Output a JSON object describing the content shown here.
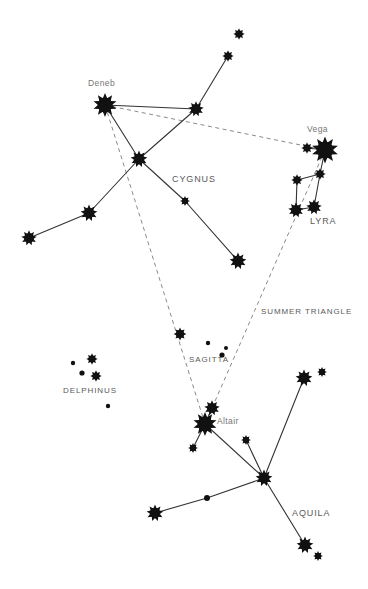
{
  "figure": {
    "kind": "star-chart",
    "title_visible": false,
    "background_color": "#ffffff",
    "star_color": "#111111",
    "line_color": "#333333",
    "dashed_color": "#8a8a8a",
    "label_color": "#6b6b6b",
    "width": 368,
    "height": 589
  },
  "labels": [
    {
      "name": "deneb-label",
      "text": "Deneb",
      "x": 88,
      "y": 78,
      "style": "label-star"
    },
    {
      "name": "vega-label",
      "text": "Vega",
      "x": 307,
      "y": 124,
      "style": "label-star"
    },
    {
      "name": "altair-label",
      "text": "Altair",
      "x": 217,
      "y": 416,
      "style": "label-star"
    },
    {
      "name": "cygnus-label",
      "text": "CYGNUS",
      "x": 172,
      "y": 174,
      "style": "label-const"
    },
    {
      "name": "lyra-label",
      "text": "LYRA",
      "x": 310,
      "y": 216,
      "style": "label-const"
    },
    {
      "name": "aquila-label",
      "text": "AQUILA",
      "x": 292,
      "y": 508,
      "style": "label-const"
    },
    {
      "name": "sagitta-label",
      "text": "SAGITTA",
      "x": 189,
      "y": 355,
      "style": "label-region"
    },
    {
      "name": "delphinus-label",
      "text": "DELPHINUS",
      "x": 63,
      "y": 386,
      "style": "label-region"
    },
    {
      "name": "summer-triangle-label",
      "text": "SUMMER TRIANGLE",
      "x": 261,
      "y": 307,
      "style": "label-region"
    }
  ],
  "stars": [
    {
      "name": "star-deneb",
      "id": "deneb",
      "x": 105,
      "y": 105,
      "r": 8.5
    },
    {
      "name": "star-vega",
      "id": "vega",
      "x": 325,
      "y": 150,
      "r": 9.5
    },
    {
      "name": "star-altair",
      "id": "altair",
      "x": 205,
      "y": 424,
      "r": 8.5
    },
    {
      "name": "star-cygnus-sadr",
      "id": "sadr",
      "x": 139,
      "y": 159,
      "r": 6.0
    },
    {
      "name": "star-cygnus-gienah-e",
      "id": "gienah-e",
      "x": 196,
      "y": 109,
      "r": 5.5
    },
    {
      "name": "star-cygnus-upper",
      "id": "cyg-up",
      "x": 228,
      "y": 56,
      "r": 4.0
    },
    {
      "name": "star-cygnus-top",
      "id": "cyg-top",
      "x": 239,
      "y": 34,
      "r": 4.0
    },
    {
      "name": "star-cygnus-gienah-w",
      "id": "gienah-w",
      "x": 89,
      "y": 213,
      "r": 6.0
    },
    {
      "name": "star-cygnus-wing-tip",
      "id": "wing-tip",
      "x": 29,
      "y": 238,
      "r": 5.5
    },
    {
      "name": "star-cygnus-eta",
      "id": "cyg-eta",
      "x": 185,
      "y": 201,
      "r": 3.5
    },
    {
      "name": "star-cygnus-albireo",
      "id": "albireo",
      "x": 238,
      "y": 261,
      "r": 6.0
    },
    {
      "name": "star-lyra-epsilon",
      "id": "lyr-eps",
      "x": 307,
      "y": 148,
      "r": 4.0
    },
    {
      "name": "star-lyra-zeta",
      "id": "lyr-zeta",
      "x": 320,
      "y": 174,
      "r": 4.0
    },
    {
      "name": "star-lyra-delta",
      "id": "lyr-delt",
      "x": 297,
      "y": 180,
      "r": 4.0
    },
    {
      "name": "star-lyra-beta",
      "id": "lyr-beta",
      "x": 296,
      "y": 210,
      "r": 5.5
    },
    {
      "name": "star-lyra-gamma",
      "id": "lyr-gam",
      "x": 314,
      "y": 207,
      "r": 5.5
    },
    {
      "name": "star-sagitta-gamma",
      "id": "sge-gam",
      "x": 180,
      "y": 334,
      "r": 4.5
    },
    {
      "name": "star-sagitta-delta",
      "id": "sge-delt",
      "x": 208,
      "y": 343,
      "r": 2.2
    },
    {
      "name": "star-sagitta-alpha",
      "id": "sge-alp",
      "x": 226,
      "y": 348,
      "r": 2.0
    },
    {
      "name": "star-sagitta-beta",
      "id": "sge-beta",
      "x": 222,
      "y": 355,
      "r": 2.6
    },
    {
      "name": "star-delphinus-a",
      "id": "del-a",
      "x": 73,
      "y": 363,
      "r": 2.2
    },
    {
      "name": "star-delphinus-b",
      "id": "del-b",
      "x": 92,
      "y": 359,
      "r": 4.0
    },
    {
      "name": "star-delphinus-c",
      "id": "del-c",
      "x": 82,
      "y": 373,
      "r": 2.6
    },
    {
      "name": "star-delphinus-d",
      "id": "del-d",
      "x": 96,
      "y": 376,
      "r": 4.0
    },
    {
      "name": "star-delphinus-e",
      "id": "del-e",
      "x": 108,
      "y": 406,
      "r": 2.2
    },
    {
      "name": "star-aquila-tarazed",
      "id": "tarazed",
      "x": 212,
      "y": 408,
      "r": 5.5
    },
    {
      "name": "star-aquila-alshain",
      "id": "alshain",
      "x": 193,
      "y": 448,
      "r": 3.5
    },
    {
      "name": "star-aquila-delta",
      "id": "aql-delt",
      "x": 246,
      "y": 440,
      "r": 3.5
    },
    {
      "name": "star-aquila-eta",
      "id": "aql-eta",
      "x": 264,
      "y": 478,
      "r": 6.0
    },
    {
      "name": "star-aquila-theta",
      "id": "aql-thet",
      "x": 207,
      "y": 498,
      "r": 3.0
    },
    {
      "name": "star-aquila-lambda",
      "id": "aql-lamb",
      "x": 155,
      "y": 513,
      "r": 6.0
    },
    {
      "name": "star-aquila-zeta",
      "id": "aql-zeta",
      "x": 304,
      "y": 378,
      "r": 6.0
    },
    {
      "name": "star-aquila-epsilon",
      "id": "aql-eps",
      "x": 322,
      "y": 372,
      "r": 3.5
    },
    {
      "name": "star-aquila-south",
      "id": "aql-sth",
      "x": 305,
      "y": 545,
      "r": 6.0
    },
    {
      "name": "star-aquila-south-tip",
      "id": "aql-stip",
      "x": 318,
      "y": 556,
      "r": 3.5
    }
  ],
  "solid_lines": [
    {
      "name": "line-deneb-sadr",
      "from": "deneb",
      "to": "sadr"
    },
    {
      "name": "line-deneb-gienah-e",
      "from": "deneb",
      "to": "gienah-e"
    },
    {
      "name": "line-sadr-gienah-e",
      "from": "sadr",
      "to": "gienah-e"
    },
    {
      "name": "line-gienah-e-up",
      "from": "gienah-e",
      "to": "cyg-up"
    },
    {
      "name": "line-sadr-gienah-w",
      "from": "sadr",
      "to": "gienah-w"
    },
    {
      "name": "line-gienah-w-wingtip",
      "from": "gienah-w",
      "to": "wing-tip"
    },
    {
      "name": "line-sadr-eta",
      "from": "sadr",
      "to": "cyg-eta"
    },
    {
      "name": "line-eta-albireo",
      "from": "cyg-eta",
      "to": "albireo"
    },
    {
      "name": "line-vega-epsilon",
      "from": "vega",
      "to": "lyr-eps"
    },
    {
      "name": "line-vega-zeta",
      "from": "vega",
      "to": "lyr-zeta"
    },
    {
      "name": "line-zeta-delta",
      "from": "lyr-zeta",
      "to": "lyr-delt"
    },
    {
      "name": "line-delta-beta",
      "from": "lyr-delt",
      "to": "lyr-beta"
    },
    {
      "name": "line-beta-gamma",
      "from": "lyr-beta",
      "to": "lyr-gam"
    },
    {
      "name": "line-gamma-zeta",
      "from": "lyr-gam",
      "to": "lyr-zeta"
    },
    {
      "name": "line-altair-tarazed",
      "from": "altair",
      "to": "tarazed"
    },
    {
      "name": "line-altair-alshain",
      "from": "altair",
      "to": "alshain"
    },
    {
      "name": "line-altair-eta",
      "from": "altair",
      "to": "aql-eta"
    },
    {
      "name": "line-delta-eta",
      "from": "aql-delt",
      "to": "aql-eta"
    },
    {
      "name": "line-eta-zeta",
      "from": "aql-eta",
      "to": "aql-zeta"
    },
    {
      "name": "line-eta-theta",
      "from": "aql-eta",
      "to": "aql-thet"
    },
    {
      "name": "line-theta-lambda",
      "from": "aql-thet",
      "to": "aql-lamb"
    },
    {
      "name": "line-eta-south",
      "from": "aql-eta",
      "to": "aql-sth"
    }
  ],
  "dashed_lines": [
    {
      "name": "triangle-deneb-vega",
      "from": "deneb",
      "to": "vega"
    },
    {
      "name": "triangle-vega-altair",
      "from": "vega",
      "to": "altair"
    },
    {
      "name": "triangle-altair-deneb",
      "from": "altair",
      "to": "deneb"
    }
  ]
}
